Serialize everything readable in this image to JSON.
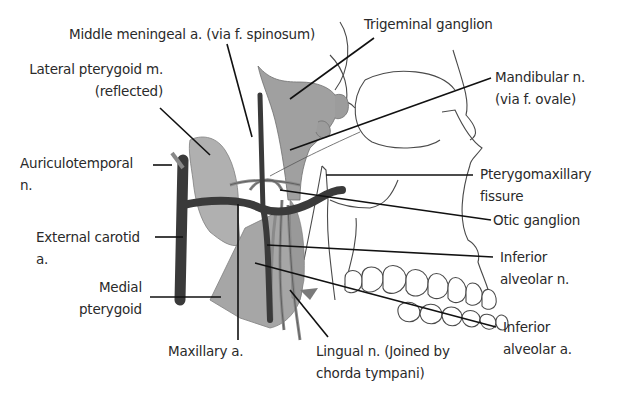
{
  "figure": {
    "colors": {
      "background": "#ffffff",
      "muscle_fill": "#a8a8a8",
      "ganglion_fill": "#8e8e8e",
      "artery_fill": "#3a3a3a",
      "nerve_fill": "#9a9a9a",
      "outline": "#4a4a4a",
      "leader_line": "#111111",
      "label_text": "#2a2a2a"
    }
  },
  "labels": {
    "middle_meningeal": "Middle meningeal a. (via f. spinosum)",
    "trigeminal_ganglion": "Trigeminal ganglion",
    "lateral_pterygoid_1": "Lateral pterygoid m.",
    "lateral_pterygoid_2": "(reflected)",
    "mandibular_n_1": "Mandibular n.",
    "mandibular_n_2": "(via f. ovale)",
    "auriculotemporal_1": "Auriculotemporal",
    "auriculotemporal_2": "n.",
    "pterygomaxillary_1": "Pterygomaxillary",
    "pterygomaxillary_2": "fissure",
    "otic_ganglion": "Otic ganglion",
    "external_carotid_1": "External carotid",
    "external_carotid_2": "a.",
    "inferior_alveolar_n_1": "Inferior",
    "inferior_alveolar_n_2": "alveolar n.",
    "medial_pterygoid_1": "Medial",
    "medial_pterygoid_2": "pterygoid",
    "inferior_alveolar_a_1": "Inferior",
    "inferior_alveolar_a_2": "alveolar a.",
    "maxillary_a": "Maxillary a.",
    "lingual_n_1": "Lingual n. (Joined by",
    "lingual_n_2": "chorda tympani)"
  }
}
